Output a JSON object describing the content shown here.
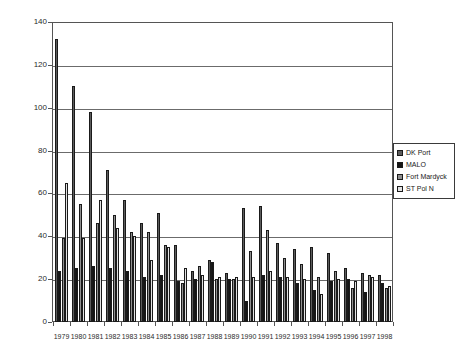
{
  "chart_data": {
    "type": "bar",
    "title": "",
    "xlabel": "",
    "ylabel": "",
    "ylim": [
      0,
      140
    ],
    "ytick_step": 20,
    "yticks": [
      "0",
      "20",
      "40",
      "60",
      "80",
      "100",
      "120",
      "140"
    ],
    "grid": true,
    "legend_position": "right",
    "categories": [
      "1979",
      "1980",
      "1981",
      "1982",
      "1983",
      "1984",
      "1985",
      "1986",
      "1987",
      "1988",
      "1989",
      "1990",
      "1991",
      "1992",
      "1993",
      "1994",
      "1995",
      "1996",
      "1997",
      "1998"
    ],
    "series": [
      {
        "name": "DK Port",
        "color": "#5c5c5c",
        "values": [
          132,
          110,
          98,
          71,
          57,
          46,
          51,
          36,
          24,
          29,
          23,
          53,
          54,
          37,
          34,
          35,
          32,
          25,
          23,
          22
        ]
      },
      {
        "name": "MALO",
        "color": "#151515",
        "values": [
          24,
          25,
          26,
          25,
          24,
          21,
          22,
          19,
          20,
          28,
          20,
          10,
          22,
          21,
          18,
          15,
          19,
          20,
          14,
          18
        ]
      },
      {
        "name": "Fort Mardyck",
        "color": "#8e8e8e",
        "values": [
          39,
          55,
          46,
          50,
          42,
          42,
          36,
          18,
          26,
          20,
          20,
          33,
          43,
          30,
          27,
          21,
          24,
          16,
          22,
          16
        ]
      },
      {
        "name": "ST Pol N",
        "color": "#e2e2e2",
        "values": [
          65,
          39,
          57,
          44,
          40,
          29,
          35,
          25,
          22,
          21,
          21,
          21,
          24,
          21,
          20,
          13,
          20,
          19,
          21,
          17
        ]
      }
    ]
  },
  "legend": {
    "items": [
      {
        "label": "DK Port"
      },
      {
        "label": "MALO"
      },
      {
        "label": "Fort Mardyck"
      },
      {
        "label": "ST Pol N"
      }
    ]
  }
}
